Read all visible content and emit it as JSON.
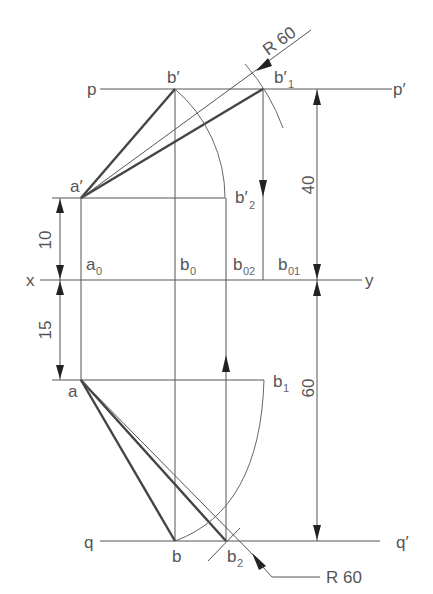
{
  "labels": {
    "p": "p",
    "p_prime": "p′",
    "q": "q",
    "q_prime": "q′",
    "x": "x",
    "y": "y",
    "a_prime": "a′",
    "a": "a",
    "b_prime": "b′",
    "b": "b",
    "b1_prime": {
      "main": "b′",
      "sub": "1"
    },
    "b2_prime": {
      "main": "b′",
      "sub": "2"
    },
    "a0": {
      "main": "a",
      "sub": "0"
    },
    "b0": {
      "main": "b",
      "sub": "0"
    },
    "b02": {
      "main": "b",
      "sub": "02"
    },
    "b01": {
      "main": "b",
      "sub": "01"
    },
    "b1": {
      "main": "b",
      "sub": "1"
    },
    "b2": {
      "main": "b",
      "sub": "2"
    }
  },
  "dimensions": {
    "top_radius": "R 60",
    "bottom_radius": "R 60",
    "height_above_xy": "40",
    "height_below_xy": "60",
    "a_prime_above_xy": "10",
    "a_below_xy": "15"
  },
  "colors": {
    "line": "#555555",
    "thick_line": "#444444",
    "background": "#ffffff"
  }
}
